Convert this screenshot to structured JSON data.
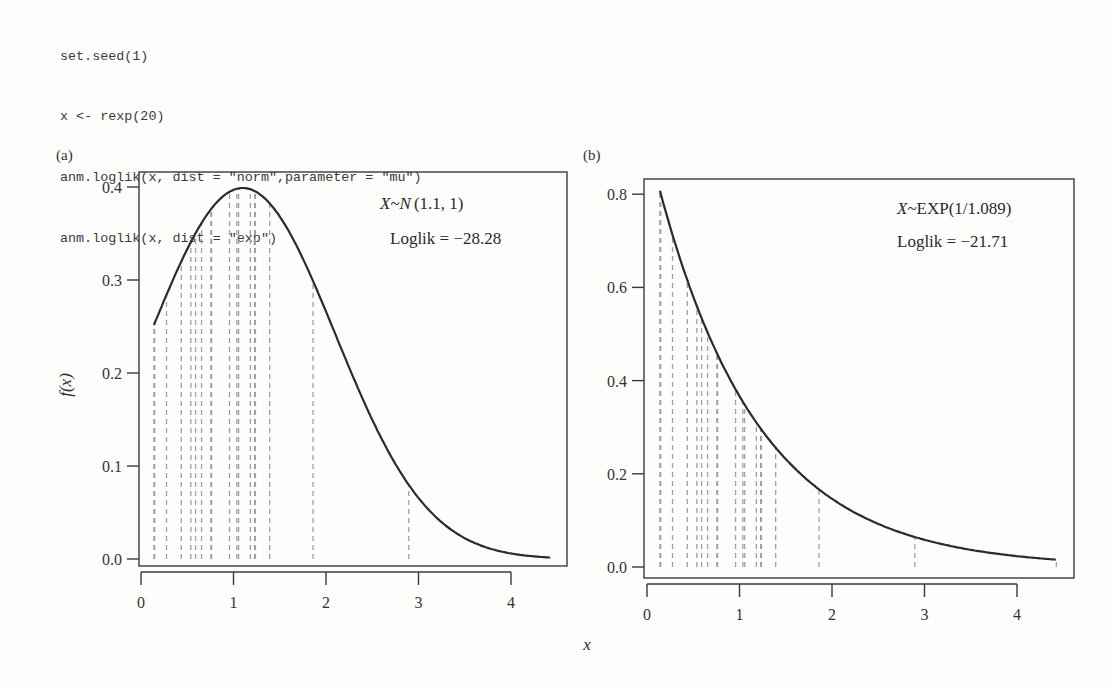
{
  "code": {
    "lines": [
      "set.seed(1)",
      "x <- rexp(20)",
      "anm.loglik(x, dist = \"norm\",parameter = \"mu\")",
      "anm.loglik(x, dist = \"exp\")"
    ]
  },
  "colors": {
    "curve": "#2b2b2b",
    "dashed": "#a0a0a0",
    "axis": "#3a3a3a",
    "background": "#fdfdfb"
  },
  "chart_data": [
    {
      "type": "line",
      "panel_label": "(a)",
      "title": "",
      "annotation_line1": "X~N(1.1, 1)",
      "annotation_dist_var": "X",
      "annotation_dist_name": "N",
      "annotation_dist_params": "(1.1, 1)",
      "annotation_line2": "Loglik = −28.28",
      "xlabel": "x",
      "ylabel": "f(x)",
      "xlim": [
        0,
        4.5
      ],
      "ylim": [
        0,
        0.4
      ],
      "xticks": [
        "0",
        "1",
        "2",
        "3",
        "4"
      ],
      "yticks": [
        "0.0",
        "0.1",
        "0.2",
        "0.3",
        "0.4"
      ],
      "distribution": {
        "name": "normal",
        "mean": 1.1,
        "sd": 1
      },
      "loglik": -28.28,
      "curve_range": [
        0.14,
        4.42
      ],
      "samples": [
        0.755,
        1.182,
        0.146,
        0.14,
        0.436,
        2.895,
        1.229,
        0.539,
        0.957,
        0.147,
        1.391,
        0.763,
        1.237,
        4.425,
        1.055,
        1.036,
        1.86,
        0.655,
        0.276,
        0.59
      ],
      "grid": false
    },
    {
      "type": "line",
      "panel_label": "(b)",
      "title": "",
      "annotation_line1": "X~EXP(1/1.089)",
      "annotation_dist_var": "X",
      "annotation_dist_name": "~EXP(1/1.089)",
      "annotation_line2": "Loglik = −21.71",
      "xlabel": "x",
      "ylabel": "",
      "xlim": [
        0,
        4.5
      ],
      "ylim": [
        0,
        0.8
      ],
      "xticks": [
        "0",
        "1",
        "2",
        "3",
        "4"
      ],
      "yticks": [
        "0.0",
        "0.2",
        "0.4",
        "0.6",
        "0.8"
      ],
      "distribution": {
        "name": "exponential",
        "rate": 0.9183,
        "mean": 1.089
      },
      "loglik": -21.71,
      "curve_range": [
        0.14,
        4.42
      ],
      "samples": [
        0.755,
        1.182,
        0.146,
        0.14,
        0.436,
        2.895,
        1.229,
        0.539,
        0.957,
        0.147,
        1.391,
        0.763,
        1.237,
        4.425,
        1.055,
        1.036,
        1.86,
        0.655,
        0.276,
        0.59
      ],
      "grid": false
    }
  ],
  "shared_xlabel": "x"
}
